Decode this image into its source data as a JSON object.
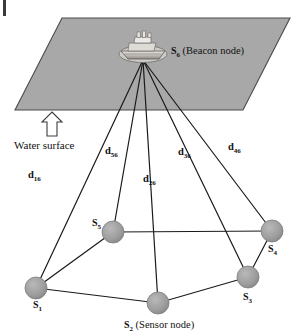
{
  "figure": {
    "type": "diagram",
    "background_color": "#ffffff",
    "plane_fill": "#a8a8a8",
    "plane_stroke": "#4a4a4a",
    "node_fill": "#9a9a9a",
    "node_stroke": "#6a6a6a",
    "line_color": "#1a1a1a",
    "text_color": "#111111"
  },
  "surface": {
    "label": "Water surface",
    "arrow_name": "up-arrow"
  },
  "beacon": {
    "symbol": "S",
    "subscript": "6",
    "caption": "(Beacon node)",
    "icon": "ship-icon",
    "x": 143,
    "y": 58
  },
  "nodes": [
    {
      "id": "S1",
      "symbol": "S",
      "subscript": "1",
      "caption": "",
      "x": 36,
      "y": 288,
      "r": 11,
      "label_x": 33,
      "label_y": 302
    },
    {
      "id": "S2",
      "symbol": "S",
      "subscript": "2",
      "caption": "(Sensor node)",
      "x": 158,
      "y": 303,
      "r": 11,
      "label_x": 124,
      "label_y": 320
    },
    {
      "id": "S3",
      "symbol": "S",
      "subscript": "3",
      "caption": "",
      "x": 248,
      "y": 277,
      "r": 11,
      "label_x": 243,
      "label_y": 294
    },
    {
      "id": "S4",
      "symbol": "S",
      "subscript": "4",
      "caption": "",
      "x": 272,
      "y": 231,
      "r": 11,
      "label_x": 268,
      "label_y": 246
    },
    {
      "id": "S5",
      "symbol": "S",
      "subscript": "5",
      "caption": "",
      "x": 113,
      "y": 232,
      "r": 11,
      "label_x": 92,
      "label_y": 222
    }
  ],
  "distances": [
    {
      "id": "d16",
      "symbol": "d",
      "subscript": "16",
      "x": 28,
      "y": 176
    },
    {
      "id": "d56",
      "symbol": "d",
      "subscript": "56",
      "x": 105,
      "y": 152
    },
    {
      "id": "d26",
      "symbol": "d",
      "subscript": "26",
      "x": 143,
      "y": 180
    },
    {
      "id": "d36",
      "symbol": "d",
      "subscript": "36",
      "x": 178,
      "y": 153
    },
    {
      "id": "d46",
      "symbol": "d",
      "subscript": "46",
      "x": 228,
      "y": 148
    }
  ],
  "polygon_edges": [
    [
      "S1",
      "S2"
    ],
    [
      "S2",
      "S3"
    ],
    [
      "S3",
      "S4"
    ],
    [
      "S4",
      "S5"
    ],
    [
      "S5",
      "S1"
    ]
  ],
  "plane_points": "62,18 290,18 243,110 15,110"
}
